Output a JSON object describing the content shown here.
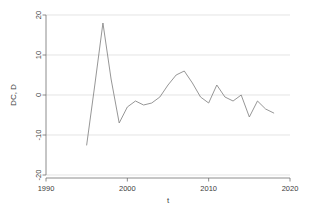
{
  "chart_data": {
    "type": "line",
    "title": "",
    "subtitle": "",
    "xlabel": "t",
    "ylabel": "DC, D",
    "xlim": [
      1990,
      2020
    ],
    "ylim": [
      -20,
      20
    ],
    "xticks": [
      1990,
      2000,
      2010,
      2020
    ],
    "xtick_labels": [
      "1990",
      "2000",
      "2010",
      "2020"
    ],
    "yticks": [
      -20,
      -10,
      0,
      10,
      20
    ],
    "ytick_labels": [
      "-20",
      "-10",
      "0",
      "10",
      "20"
    ],
    "grid": true,
    "grid_axis": "y",
    "legend": "none",
    "series": [
      {
        "name": "DC, D",
        "color": "#8a8a8a",
        "marker": "none",
        "x": [
          1995,
          1996,
          1997,
          1998,
          1999,
          2000,
          2001,
          2002,
          2003,
          2004,
          2005,
          2006,
          2007,
          2008,
          2009,
          2010,
          2011,
          2012,
          2013,
          2014,
          2015,
          2016,
          2017,
          2018
        ],
        "values": [
          -12.5,
          2.5,
          18.0,
          4.0,
          -7.0,
          -3.0,
          -1.5,
          -2.5,
          -2.0,
          -0.5,
          2.5,
          5.0,
          6.0,
          3.0,
          -0.5,
          -2.0,
          2.5,
          -0.5,
          -1.5,
          0.0,
          -5.5,
          -1.5,
          -3.5,
          -4.5
        ]
      }
    ]
  },
  "axis": {
    "y_title": "DC, D",
    "x_title": "t"
  },
  "colors": {
    "line": "#8a8a8a",
    "grid": "#d8d8d8",
    "axis": "#6e6e6e",
    "text": "#3c3c3c",
    "background": "#ffffff"
  }
}
